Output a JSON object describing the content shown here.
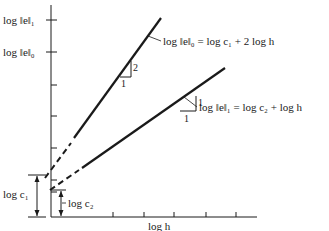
{
  "figure": {
    "y_axis_labels": {
      "e1": "log ‖e‖₁",
      "e0": "log ‖e‖₀"
    },
    "x_axis_label": "log h",
    "equations": {
      "upper": "log ‖e‖₀ = log c₁ + 2 log h",
      "lower": "log ‖e‖₁ = log c₂ + log h"
    },
    "slope_triangles": {
      "upper": {
        "run": "1",
        "rise": "2"
      },
      "lower": {
        "run": "1",
        "rise": "1"
      }
    },
    "intercepts": {
      "c1": "log c₁",
      "c2": "log c₂"
    },
    "colors": {
      "ink": "#1a1a1a",
      "background": "#ffffff"
    }
  }
}
